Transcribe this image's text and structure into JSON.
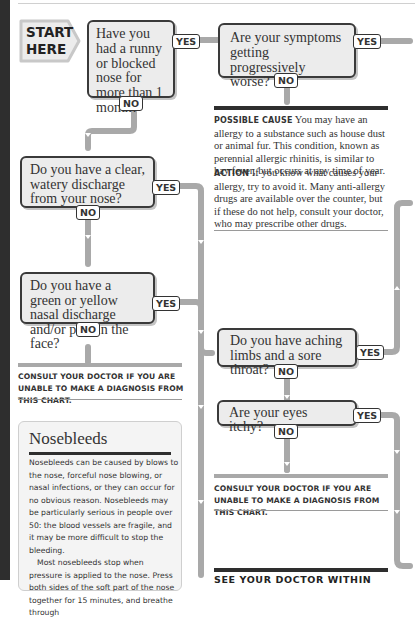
{
  "start": {
    "line1": "START",
    "line2": "HERE"
  },
  "questions": [
    {
      "id": "q1",
      "text": "Have you had a runny or blocked nose for more than 1 month?",
      "yes": "YES",
      "no": "NO"
    },
    {
      "id": "q2",
      "text": "Are your symptoms getting progressively worse?",
      "yes": "YES",
      "no": "NO"
    },
    {
      "id": "q3",
      "text": "Do you have a clear, watery discharge from your nose?",
      "yes": "YES",
      "no": "NO"
    },
    {
      "id": "q4",
      "text": "Do you have a green or yellow nasal discharge and/or pain in the face?",
      "yes": "YES",
      "no": "NO"
    },
    {
      "id": "q5",
      "text": "Do you have aching limbs and a sore throat?",
      "yes": "YES",
      "no": "NO"
    },
    {
      "id": "q6",
      "text": "Are your eyes itchy?",
      "yes": "YES",
      "no": "NO"
    }
  ],
  "possible_cause": {
    "label": "Possible cause",
    "text": "You may have an allergy to a substance such as house dust or animal fur. This condition, known as perennial allergic rhinitis, is similar to hay fever, but occurs at any time of year."
  },
  "action": {
    "label": "Action",
    "text": "If you know what causes your allergy, try to avoid it. Many anti-allergy drugs are available over the counter, but if these do not help, consult your doctor, who may prescribe other drugs."
  },
  "consult_notes": [
    "Consult your doctor if you are unable to make a diagnosis from this chart.",
    "Consult your doctor if you are unable to make a diagnosis from this chart."
  ],
  "nosebleeds": {
    "title": "Nosebleeds",
    "para1": "Nosebleeds can be caused by blows to the nose, forceful nose blowing, or nasal infections, or they can occur for no obvious reason. Nosebleeds may be particularly serious in people over 50: the blood vessels are fragile, and it may be more difficult to stop the bleeding.",
    "para2": "Most nosebleeds stop when pressure is applied to the nose. Press both sides of the soft part of the nose together for 15 minutes, and breathe through"
  },
  "see_doctor": "SEE YOUR DOCTOR WITHIN",
  "colors": {
    "connector": "#a9a9a9",
    "box_fill": "#ececec",
    "box_border": "#3a3a3a",
    "rule_dark": "#2e2e2e",
    "spine": "#2e2e2e"
  }
}
